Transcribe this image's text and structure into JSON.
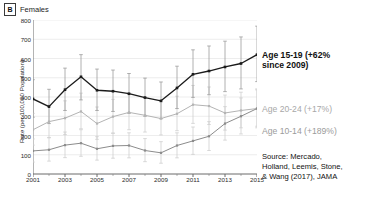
{
  "panel": {
    "letter": "B",
    "title": "Females"
  },
  "chart_data": {
    "type": "line",
    "title": "Females",
    "xlabel": "",
    "ylabel": "Rate (per 100,000 Population)",
    "xlim": [
      2001,
      2015
    ],
    "ylim": [
      0,
      800
    ],
    "grid": true,
    "legend_position": "annotations-right",
    "xticks": [
      2001,
      2003,
      2005,
      2007,
      2009,
      2011,
      2013,
      2015
    ],
    "xtick_labels": [
      "2001",
      "2003",
      "2005",
      "2007",
      "2009",
      "2011",
      "2013",
      "2015"
    ],
    "minor_xticks": [
      2002,
      2004,
      2006,
      2008,
      2010,
      2012,
      2014
    ],
    "yticks": [
      0,
      100,
      200,
      300,
      400,
      500,
      600,
      700,
      800
    ],
    "ytick_labels": [
      "0",
      "100",
      "200",
      "300",
      "400",
      "500",
      "600",
      "700",
      "800"
    ],
    "x": [
      2001,
      2002,
      2003,
      2004,
      2005,
      2006,
      2007,
      2008,
      2009,
      2010,
      2011,
      2012,
      2013,
      2014,
      2015
    ],
    "series": [
      {
        "name": "Age 15-19",
        "color": "#1b1b1b",
        "values": [
          390,
          350,
          438,
          505,
          435,
          430,
          417,
          397,
          380,
          447,
          518,
          535,
          556,
          574,
          620
        ],
        "err_low": [
          295,
          262,
          330,
          385,
          330,
          325,
          315,
          300,
          287,
          340,
          398,
          412,
          428,
          442,
          480
        ],
        "err_high": [
          490,
          440,
          550,
          620,
          545,
          540,
          522,
          498,
          478,
          560,
          645,
          665,
          690,
          712,
          768
        ]
      },
      {
        "name": "Age 20-24",
        "color": "#b4b4b4",
        "values": [
          230,
          272,
          290,
          325,
          262,
          298,
          320,
          305,
          288,
          313,
          360,
          353,
          317,
          330,
          340
        ],
        "err_low": [
          150,
          190,
          205,
          235,
          180,
          212,
          230,
          218,
          203,
          225,
          263,
          257,
          228,
          240,
          248
        ],
        "err_high": [
          315,
          358,
          380,
          420,
          348,
          388,
          412,
          395,
          375,
          404,
          460,
          452,
          410,
          425,
          437
        ]
      },
      {
        "name": "Age 10-14",
        "color": "#8c8c8c",
        "values": [
          120,
          126,
          150,
          160,
          131,
          146,
          148,
          122,
          110,
          148,
          172,
          196,
          262,
          300,
          340
        ],
        "err_low": [
          62,
          67,
          85,
          92,
          72,
          82,
          84,
          64,
          56,
          84,
          102,
          122,
          176,
          208,
          240
        ],
        "err_high": [
          182,
          188,
          218,
          230,
          194,
          212,
          214,
          184,
          168,
          214,
          244,
          272,
          350,
          395,
          442
        ]
      }
    ],
    "annotations": [
      {
        "name": "age-15-19",
        "text": "Age 15-19 (+62%\nsince 2009)",
        "color": "#111111"
      },
      {
        "name": "age-20-24",
        "text": "Age 20-24 (+17%)",
        "color": "#a8a8a8"
      },
      {
        "name": "age-10-14",
        "text": "Age 10-14 (+189%)",
        "color": "#9b9b9b"
      }
    ],
    "source": "Source: Mercado,\nHolland, Leemis, Stone,\n& Wang (2017), JAMA"
  }
}
